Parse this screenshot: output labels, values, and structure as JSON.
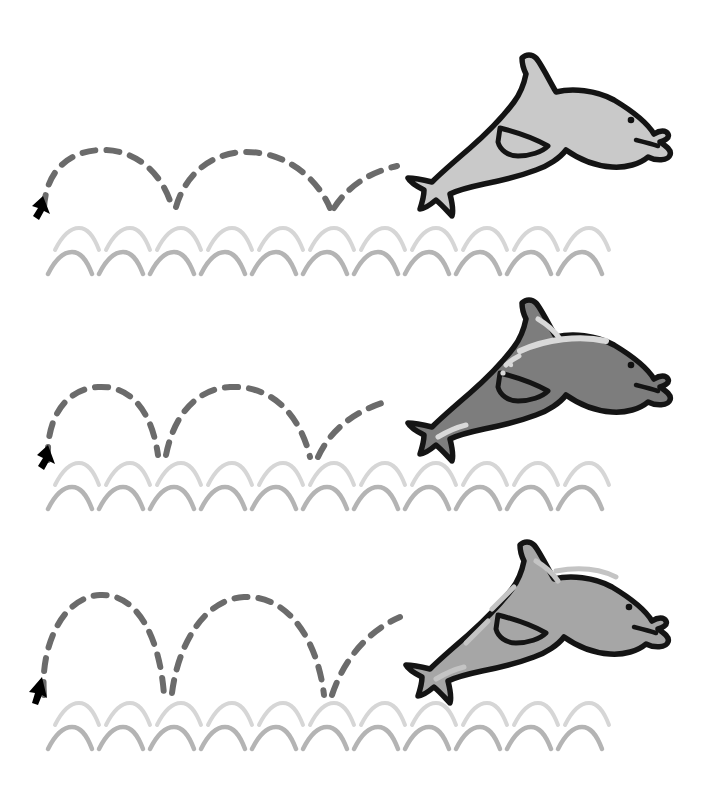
{
  "illustration": {
    "title": "Dolphin Jumping Over Waves",
    "description": "Three stacked panels, each showing a dolphin leaping above the sea with a dashed bouncing trajectory line beginning at a black arrow.",
    "background_color": "#ffffff",
    "panel_count": 3
  },
  "palette": {
    "outline": "#141414",
    "dashed_path": "#6b6b6b",
    "arrow": "#000000",
    "wave_top": "#d6d6d6",
    "wave_bottom": "#b4b4b4",
    "dolphin_light": "#c9c9c9",
    "dolphin_dark": "#7d7d7d",
    "dolphin_medium": "#a6a6a6",
    "highlight": "#d9d9d9",
    "eye": "#111111"
  },
  "panels": [
    {
      "id": "panel-1",
      "label": "Panel 1",
      "dolphin": {
        "name": "dolphin-light",
        "body_color": "#c9c9c9",
        "outline_color": "#141414",
        "highlights": false,
        "eye_color": "#111111"
      },
      "trajectory": {
        "name": "bounce-path-low",
        "style": "dashed",
        "color": "#6b6b6b",
        "dash_pattern": "13 11",
        "stroke_width": 6,
        "arc_count": 3,
        "arc_height": 58,
        "start_marker": "arrow-up-right"
      },
      "waves": {
        "rows": 2,
        "top_color": "#d6d6d6",
        "bottom_color": "#b4b4b4",
        "repetitions": 11
      }
    },
    {
      "id": "panel-2",
      "label": "Panel 2",
      "dolphin": {
        "name": "dolphin-dark",
        "body_color": "#7d7d7d",
        "outline_color": "#141414",
        "highlights": true,
        "highlight_color": "#d9d9d9",
        "eye_color": "#111111"
      },
      "trajectory": {
        "name": "bounce-path-medium",
        "style": "dashed",
        "color": "#6b6b6b",
        "dash_pattern": "13 11",
        "stroke_width": 6,
        "arc_count": 3,
        "arc_height": 86,
        "start_marker": "arrow-up-right"
      },
      "waves": {
        "rows": 2,
        "top_color": "#d6d6d6",
        "bottom_color": "#b4b4b4",
        "repetitions": 11
      }
    },
    {
      "id": "panel-3",
      "label": "Panel 3",
      "dolphin": {
        "name": "dolphin-medium",
        "body_color": "#a6a6a6",
        "outline_color": "#141414",
        "highlights": true,
        "highlight_color": "#c4c4c4",
        "eye_color": "#111111"
      },
      "trajectory": {
        "name": "bounce-path-high",
        "style": "dashed",
        "color": "#6b6b6b",
        "dash_pattern": "13 11",
        "stroke_width": 6,
        "arc_count": 3,
        "arc_height": 104,
        "start_marker": "arrow-up-right"
      },
      "waves": {
        "rows": 2,
        "top_color": "#d6d6d6",
        "bottom_color": "#b4b4b4",
        "repetitions": 11
      }
    }
  ]
}
